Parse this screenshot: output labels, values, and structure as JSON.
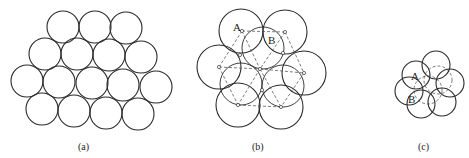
{
  "figure": {
    "panels": [
      {
        "id": "a",
        "caption": "(a)",
        "caption_pos": [
          85,
          148
        ],
        "radius": 16,
        "circles": [
          [
            63,
            27
          ],
          [
            95,
            27
          ],
          [
            126,
            28
          ],
          [
            45,
            54
          ],
          [
            77,
            54
          ],
          [
            109,
            55
          ],
          [
            141,
            57
          ],
          [
            27,
            81
          ],
          [
            59,
            82
          ],
          [
            92,
            83
          ],
          [
            123,
            85
          ],
          [
            156,
            87
          ],
          [
            42,
            109
          ],
          [
            74,
            111
          ],
          [
            106,
            113
          ],
          [
            138,
            114
          ]
        ]
      },
      {
        "id": "b",
        "caption": "(b)",
        "caption_pos": [
          259,
          148
        ],
        "radius_outer": 22,
        "outer_circles": [
          [
            241,
            31
          ],
          [
            285,
            32
          ],
          [
            219,
            67
          ],
          [
            304,
            73
          ],
          [
            238,
            105
          ],
          [
            281,
            107
          ]
        ],
        "radius_inner": 21,
        "inner_circles": [
          [
            263,
            48
          ],
          [
            241,
            84
          ],
          [
            283,
            86
          ]
        ],
        "lattice_points": [
          [
            242,
            31
          ],
          [
            285,
            32
          ],
          [
            219,
            67
          ],
          [
            260,
            69
          ],
          [
            304,
            73
          ],
          [
            238,
            105
          ],
          [
            281,
            107
          ],
          [
            240,
            55
          ],
          [
            262,
            90
          ],
          [
            283,
            53
          ]
        ],
        "lattice_edges": [
          [
            [
              242,
              31
            ],
            [
              285,
              32
            ]
          ],
          [
            [
              219,
              67
            ],
            [
              260,
              69
            ]
          ],
          [
            [
              260,
              69
            ],
            [
              304,
              73
            ]
          ],
          [
            [
              238,
              105
            ],
            [
              281,
              107
            ]
          ],
          [
            [
              242,
              31
            ],
            [
              219,
              67
            ]
          ],
          [
            [
              242,
              31
            ],
            [
              260,
              69
            ]
          ],
          [
            [
              285,
              32
            ],
            [
              260,
              69
            ]
          ],
          [
            [
              285,
              32
            ],
            [
              304,
              73
            ]
          ],
          [
            [
              219,
              67
            ],
            [
              238,
              105
            ]
          ],
          [
            [
              260,
              69
            ],
            [
              238,
              105
            ]
          ],
          [
            [
              260,
              69
            ],
            [
              281,
              107
            ]
          ],
          [
            [
              304,
              73
            ],
            [
              281,
              107
            ]
          ]
        ],
        "labels": [
          {
            "text": "A",
            "pos": [
              233,
              31
            ]
          },
          {
            "text": "B",
            "pos": [
              268,
              44
            ]
          }
        ]
      },
      {
        "id": "c",
        "caption": "(c)",
        "caption_pos": [
          425,
          148
        ],
        "radius": 14,
        "solid_circles": [
          [
            416,
            75
          ],
          [
            436,
            65
          ],
          [
            450,
            83
          ],
          [
            442,
            102
          ],
          [
            421,
            104
          ],
          [
            409,
            91
          ]
        ],
        "dashed_circles": [
          [
            428,
            90
          ],
          [
            438,
            80
          ]
        ],
        "labels": [
          {
            "text": "A",
            "pos": [
              411,
              80
            ]
          },
          {
            "text": "B",
            "pos": [
              408,
              103
            ]
          }
        ]
      }
    ]
  }
}
